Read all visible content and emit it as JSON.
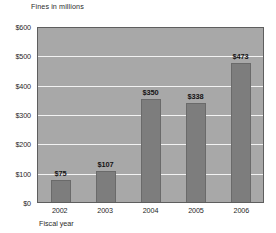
{
  "chart_data": {
    "type": "bar",
    "title": "Fines in millions",
    "xlabel": "Fiscal year",
    "ylabel": "Fines in millions",
    "categories": [
      "2002",
      "2003",
      "2004",
      "2005",
      "2006"
    ],
    "values": [
      75,
      107,
      350,
      338,
      473
    ],
    "value_labels": [
      "$75",
      "$107",
      "$350",
      "$338",
      "$473"
    ],
    "ylim": [
      0,
      600
    ],
    "ytick_values": [
      0,
      100,
      200,
      300,
      400,
      500,
      600
    ],
    "ytick_labels": [
      "$0",
      "$100",
      "$200",
      "$300",
      "$400",
      "$500",
      "$600"
    ],
    "grid": true,
    "legend": "none",
    "colors": {
      "bar": "#7d7d7d",
      "plot_background": "#a8a8a8",
      "gridline": "#f2f2f2",
      "page_background": "#ffffff",
      "axis_text": "#1f1f1f"
    }
  }
}
